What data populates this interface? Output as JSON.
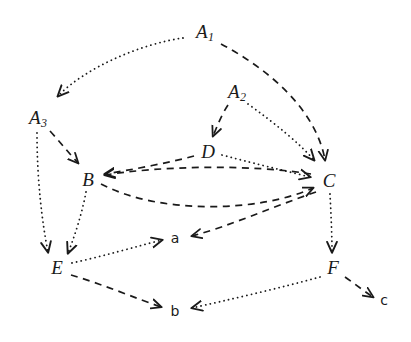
{
  "diagram": {
    "background_color": "#ffffff",
    "stroke_color": "#1a1a1a",
    "nodes": [
      {
        "id": "A1",
        "label": "A",
        "subscript": "1",
        "kind": "major",
        "x": 205,
        "y": 33
      },
      {
        "id": "A2",
        "label": "A",
        "subscript": "2",
        "kind": "major",
        "x": 237,
        "y": 93
      },
      {
        "id": "A3",
        "label": "A",
        "subscript": "3",
        "kind": "major",
        "x": 38,
        "y": 119
      },
      {
        "id": "B",
        "label": "B",
        "subscript": "",
        "kind": "major",
        "x": 88,
        "y": 179
      },
      {
        "id": "C",
        "label": "C",
        "subscript": "",
        "kind": "major",
        "x": 329,
        "y": 180
      },
      {
        "id": "D",
        "label": "D",
        "subscript": "",
        "kind": "major",
        "x": 208,
        "y": 151
      },
      {
        "id": "E",
        "label": "E",
        "subscript": "",
        "kind": "major",
        "x": 57,
        "y": 267
      },
      {
        "id": "F",
        "label": "F",
        "subscript": "",
        "kind": "major",
        "x": 333,
        "y": 267
      },
      {
        "id": "a",
        "label": "a",
        "subscript": "",
        "kind": "minor",
        "x": 175,
        "y": 238
      },
      {
        "id": "b",
        "label": "b",
        "subscript": "",
        "kind": "minor",
        "x": 175,
        "y": 311
      },
      {
        "id": "c",
        "label": "c",
        "subscript": "",
        "kind": "minor",
        "x": 384,
        "y": 300
      }
    ],
    "edges": [
      {
        "id": "A1-A3",
        "from": "A1",
        "to": "A3",
        "style": "dotted",
        "path": "M 183 38 C 140 44 85 68 58 96"
      },
      {
        "id": "A1-C",
        "from": "A1",
        "to": "C",
        "style": "dashed",
        "path": "M 221 44 C 270 70 316 110 325 160"
      },
      {
        "id": "A2-D",
        "from": "A2",
        "to": "D",
        "style": "dashed",
        "path": "M 228 105 C 222 114 218 124 213 136"
      },
      {
        "id": "A2-C",
        "from": "A2",
        "to": "C",
        "style": "dotted",
        "path": "M 248 104 C 276 124 300 144 314 160"
      },
      {
        "id": "A3-B",
        "from": "A3",
        "to": "B",
        "style": "dashed",
        "path": "M 50 131 C 60 142 68 152 78 163"
      },
      {
        "id": "A3-E",
        "from": "A3",
        "to": "E",
        "style": "dotted",
        "path": "M 37 133 C 37 180 42 222 48 252"
      },
      {
        "id": "B-E",
        "from": "B",
        "to": "E",
        "style": "dotted",
        "path": "M 86 192 C 82 214 74 238 68 253"
      },
      {
        "id": "B-C",
        "from": "B",
        "to": "C",
        "style": "dashed",
        "path": "M 101 184 C 160 215 260 212 313 188"
      },
      {
        "id": "C-B",
        "from": "C",
        "to": "B",
        "style": "dashed",
        "path": "M 311 174 C 250 164 160 166 105 175"
      },
      {
        "id": "D-B",
        "from": "D",
        "to": "B",
        "style": "dashed",
        "path": "M 194 156 C 168 163 130 170 105 174"
      },
      {
        "id": "D-C",
        "from": "D",
        "to": "C",
        "style": "dotted",
        "path": "M 222 155 C 260 165 290 172 310 177"
      },
      {
        "id": "C-a",
        "from": "C",
        "to": "a",
        "style": "dashed",
        "path": "M 316 192 C 272 207 230 226 192 236"
      },
      {
        "id": "C-F",
        "from": "C",
        "to": "F",
        "style": "dotted",
        "path": "M 330 194 C 331 214 332 234 332 252"
      },
      {
        "id": "E-a",
        "from": "E",
        "to": "a",
        "style": "dotted",
        "path": "M 72 263 C 104 256 138 246 162 240"
      },
      {
        "id": "E-b",
        "from": "E",
        "to": "b",
        "style": "dashed",
        "path": "M 71 275 C 102 284 135 298 161 307"
      },
      {
        "id": "F-b",
        "from": "F",
        "to": "b",
        "style": "dotted",
        "path": "M 320 277 C 280 288 228 300 192 308"
      },
      {
        "id": "F-c",
        "from": "F",
        "to": "c",
        "style": "dashed",
        "path": "M 345 277 C 355 284 364 291 373 297"
      }
    ]
  }
}
